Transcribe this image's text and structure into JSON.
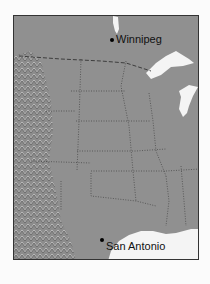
{
  "map": {
    "type": "shaded-relief",
    "region": "Central United States",
    "colors": {
      "land": "#8f8f8f",
      "water": "#f4f4f4",
      "border": "#333333",
      "background": "#fbfbfb"
    },
    "cities": [
      {
        "name": "Winnipeg",
        "x": 111,
        "y": 38
      },
      {
        "name": "San Antonio",
        "x": 101,
        "y": 239
      }
    ]
  }
}
